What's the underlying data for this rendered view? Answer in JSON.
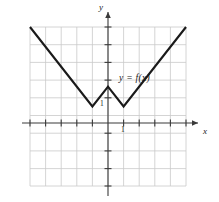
{
  "figure": {
    "background_color": "#ffffff",
    "width": 219,
    "height": 202
  },
  "labels": {
    "y_axis": "y",
    "x_axis": "x",
    "function": "y = f(x)",
    "tick_one_y": "1",
    "tick_one_x": "1"
  },
  "colors": {
    "grid": "#c9c9c9",
    "axis": "#3a3a3a",
    "curve": "#1a1a1a",
    "text": "#1a1a1a"
  },
  "chart_data": {
    "type": "line",
    "title": "",
    "subtitle": "",
    "xlabel": "x",
    "ylabel": "y",
    "xlim": [
      -5,
      5
    ],
    "ylim": [
      -4,
      4
    ],
    "xticks": [
      -5,
      -4,
      -3,
      -2,
      -1,
      0,
      1,
      2,
      3,
      4,
      5
    ],
    "yticks": [
      -4,
      -3,
      -2,
      -1,
      0,
      1,
      2,
      3,
      4
    ],
    "xtick_labels": [
      "",
      "",
      "",
      "",
      "",
      "",
      "1",
      "",
      "",
      "",
      ""
    ],
    "ytick_labels": [
      "",
      "",
      "",
      "",
      "",
      "1",
      "",
      "",
      ""
    ],
    "grid": true,
    "grid_spacing": 1,
    "legend": "",
    "annotations": [
      {
        "text": "y = f(x)",
        "x": 1.0,
        "y": 2.35
      },
      {
        "text": "1",
        "x": -0.45,
        "y": 1.0
      },
      {
        "text": "1",
        "x": 1.0,
        "y": -0.45
      }
    ],
    "series": [
      {
        "name": "y = f(x)",
        "type": "piecewise-linear",
        "color": "#1a1a1a",
        "x": [
          -5,
          -1,
          0,
          1,
          5
        ],
        "values": [
          4,
          0,
          1,
          0,
          4
        ],
        "points": [
          {
            "x": -5,
            "y": 4,
            "kind": "endpoint"
          },
          {
            "x": -1,
            "y": 0,
            "kind": "local-minimum"
          },
          {
            "x": 0,
            "y": 1,
            "kind": "local-maximum"
          },
          {
            "x": 1,
            "y": 0,
            "kind": "local-minimum"
          },
          {
            "x": 5,
            "y": 4,
            "kind": "endpoint"
          }
        ]
      }
    ]
  }
}
